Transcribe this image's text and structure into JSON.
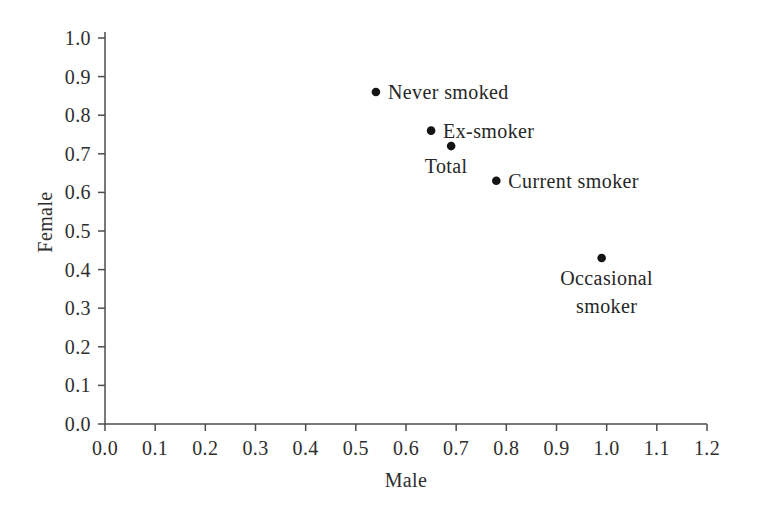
{
  "chart_data": {
    "type": "scatter",
    "title": "",
    "xlabel": "Male",
    "ylabel": "Female",
    "xlim": [
      0.0,
      1.2
    ],
    "ylim": [
      0.0,
      1.0
    ],
    "xtick_step": 0.1,
    "ytick_step": 0.1,
    "tick_decimals": 1,
    "grid": false,
    "legend": "none",
    "marker": "filled-circle",
    "points": [
      {
        "label": "Never smoked",
        "x": 0.54,
        "y": 0.86,
        "label_placement": "right"
      },
      {
        "label": "Ex-smoker",
        "x": 0.65,
        "y": 0.76,
        "label_placement": "right"
      },
      {
        "label": "Total",
        "x": 0.69,
        "y": 0.72,
        "label_placement": "below",
        "label_dx": -5,
        "label_lines": [
          "Total"
        ]
      },
      {
        "label": "Current smoker",
        "x": 0.78,
        "y": 0.63,
        "label_placement": "right"
      },
      {
        "label": "Occasional smoker",
        "x": 0.99,
        "y": 0.43,
        "label_placement": "below",
        "label_dx": 5,
        "label_lines": [
          "Occasional",
          "smoker"
        ]
      }
    ],
    "colors": {
      "background": "#ffffff",
      "axis": "#4d4d4d",
      "tick_text": "#2e2e2e",
      "label_text": "#262626",
      "point": "#141414"
    }
  }
}
